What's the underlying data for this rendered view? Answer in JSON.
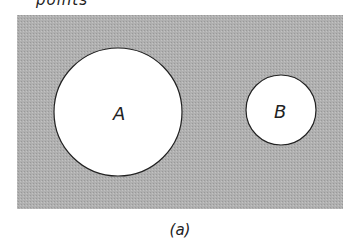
{
  "figure": {
    "clipped_title": "points",
    "caption": "(a)",
    "universe_color": "#a9a9a9",
    "sets": [
      {
        "label": "A",
        "cx": 118,
        "cy": 112,
        "r": 64
      },
      {
        "label": "B",
        "cx": 281,
        "cy": 110,
        "r": 35
      }
    ]
  }
}
